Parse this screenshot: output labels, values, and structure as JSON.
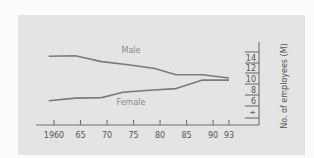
{
  "chart_data": {
    "type": "line",
    "title": "",
    "xlabel": "",
    "ylabel": "No. of employees (M)",
    "x_tick_labels": [
      "1960",
      "65",
      "70",
      "75",
      "80",
      "85",
      "90",
      "93"
    ],
    "x_ticks": [
      1960,
      1965,
      1970,
      1975,
      1980,
      1985,
      1990,
      1993
    ],
    "y_tick_labels": [
      "14",
      "12",
      "10",
      "8",
      "6"
    ],
    "y_ticks": [
      14,
      12,
      10,
      8,
      6
    ],
    "y_axis_break": true,
    "y_axis_position": "right",
    "ylim": [
      4,
      15
    ],
    "xlim": [
      1958,
      1994
    ],
    "grid": false,
    "legend": "inline labels",
    "series": [
      {
        "name": "Male",
        "x": [
          1959,
          1964,
          1969,
          1974,
          1979,
          1983,
          1988,
          1993
        ],
        "values": [
          14.1,
          14.2,
          13.1,
          12.5,
          11.8,
          10.6,
          10.6,
          10.0
        ]
      },
      {
        "name": "Female",
        "x": [
          1959,
          1964,
          1969,
          1973,
          1978,
          1983,
          1988,
          1993
        ],
        "values": [
          5.7,
          6.2,
          6.3,
          7.3,
          7.7,
          8.0,
          9.6,
          9.6
        ]
      }
    ]
  },
  "labels": {
    "male": "Male",
    "female": "Female",
    "y_axis_title": "No. of employees (M)",
    "break_symbol": "≁"
  }
}
